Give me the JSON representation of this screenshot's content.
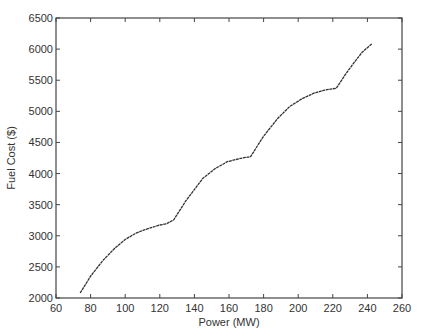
{
  "chart_data": {
    "type": "line",
    "title": "",
    "xlabel": "Power (MW)",
    "ylabel": "Fuel Cost ($)",
    "xlim": [
      60,
      260
    ],
    "ylim": [
      2000,
      6500
    ],
    "grid": false,
    "legend": null,
    "x_ticks": [
      60,
      80,
      100,
      120,
      140,
      160,
      180,
      200,
      220,
      240,
      260
    ],
    "y_ticks": [
      2000,
      2500,
      3000,
      3500,
      4000,
      4500,
      5000,
      5500,
      6000,
      6500
    ],
    "series": [
      {
        "name": "Fuel Cost",
        "color": "#333333",
        "x": [
          74,
          80,
          87,
          94,
          100,
          106,
          111,
          116,
          120,
          123.5,
          128,
          135,
          145,
          152,
          159,
          166,
          172.5,
          180,
          188,
          195,
          202,
          209,
          215,
          222,
          227,
          232,
          237,
          242.5
        ],
        "values": [
          2080,
          2350,
          2600,
          2800,
          2940,
          3040,
          3095,
          3140,
          3174,
          3190,
          3254,
          3560,
          3925,
          4080,
          4191,
          4240,
          4272,
          4600,
          4880,
          5076,
          5200,
          5291,
          5340,
          5371,
          5580,
          5773,
          5950,
          6084
        ]
      }
    ]
  },
  "axes": {
    "xlabel": "Power (MW)",
    "ylabel": "Fuel Cost ($)"
  }
}
